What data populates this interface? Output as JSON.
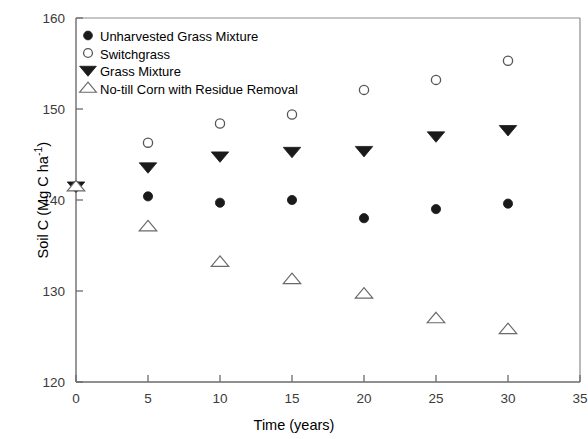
{
  "chart_data": {
    "type": "scatter",
    "title": "",
    "xlabel": "Time (years)",
    "ylabel": "Soil C (Mg C ha−1)",
    "ylabel_parts": {
      "main": "Soil C (Mg C ha",
      "superscript": "-1",
      "tail": ")"
    },
    "xlim": [
      0,
      35
    ],
    "ylim": [
      120,
      160
    ],
    "xticks": [
      0,
      5,
      10,
      15,
      20,
      25,
      30,
      35
    ],
    "yticks": [
      120,
      130,
      140,
      150,
      160
    ],
    "xtick_labels": [
      "0",
      "5",
      "10",
      "15",
      "20",
      "25",
      "30",
      "35"
    ],
    "ytick_labels": [
      "120",
      "130",
      "140",
      "150",
      "160"
    ],
    "grid": false,
    "legend_position": "top-left",
    "x": [
      0,
      5,
      10,
      15,
      20,
      25,
      30
    ],
    "series": [
      {
        "name": "Unharvested Grass Mixture",
        "marker": "filled-circle",
        "color": "#1a1a1a",
        "values": [
          141.5,
          140.4,
          139.7,
          140.0,
          138.0,
          139.0,
          139.6
        ]
      },
      {
        "name": "Switchgrass",
        "marker": "open-circle",
        "color": "#555555",
        "values": [
          141.5,
          146.3,
          148.4,
          149.4,
          152.1,
          153.2,
          155.3
        ]
      },
      {
        "name": "Grass Mixture",
        "marker": "filled-triangle-down",
        "color": "#1a1a1a",
        "values": [
          141.5,
          143.6,
          144.8,
          145.3,
          145.4,
          147.0,
          147.7
        ]
      },
      {
        "name": "No-till Corn with Residue Removal",
        "marker": "open-triangle-up",
        "color": "#6a6a6a",
        "values": [
          141.5,
          137.1,
          133.2,
          131.3,
          129.7,
          127.0,
          125.8
        ]
      }
    ]
  },
  "legend": {
    "entries": [
      {
        "label": "Unharvested Grass Mixture",
        "marker": "filled-circle"
      },
      {
        "label": "Switchgrass",
        "marker": "open-circle"
      },
      {
        "label": "Grass Mixture",
        "marker": "filled-triangle-down"
      },
      {
        "label": "No-till Corn with Residue Removal",
        "marker": "open-triangle-up"
      }
    ]
  }
}
